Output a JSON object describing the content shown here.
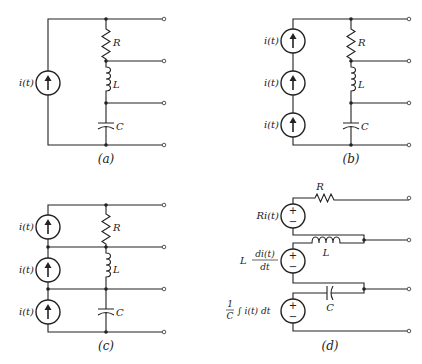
{
  "figure": {
    "panels": [
      {
        "id": "a",
        "caption": "(a)",
        "description": "Single current source i(t) driving series R-L-C with taps at each node",
        "sources": [
          {
            "label": "i(t)",
            "type": "current-source-arrow-up"
          }
        ],
        "components": [
          {
            "label": "R"
          },
          {
            "label": "L"
          },
          {
            "label": "C"
          }
        ],
        "terminals": 4
      },
      {
        "id": "b",
        "caption": "(b)",
        "description": "Three series current sources i(t) in parallel with series R-L-C",
        "sources": [
          {
            "label": "i(t)",
            "type": "current-source-arrow-up"
          },
          {
            "label": "i(t)",
            "type": "current-source-arrow-up"
          },
          {
            "label": "i(t)",
            "type": "current-source-arrow-up"
          }
        ],
        "components": [
          {
            "label": "R"
          },
          {
            "label": "L"
          },
          {
            "label": "C"
          }
        ],
        "terminals": 4
      },
      {
        "id": "c",
        "caption": "(c)",
        "description": "Each current source i(t) connected across R, L, C individually",
        "sources": [
          {
            "label": "i(t)",
            "type": "current-source-arrow-up"
          },
          {
            "label": "i(t)",
            "type": "current-source-arrow-up"
          },
          {
            "label": "i(t)",
            "type": "current-source-arrow-up"
          }
        ],
        "components": [
          {
            "label": "R"
          },
          {
            "label": "L"
          },
          {
            "label": "C"
          }
        ],
        "terminals": 4
      },
      {
        "id": "d",
        "caption": "(d)",
        "description": "Equivalent voltage sources in series with R, L, C",
        "sources": [
          {
            "label": "Ri(t)",
            "type": "voltage-source-plus-minus"
          },
          {
            "label_prefix": "L",
            "label_num": "di(t)",
            "label_den": "dt",
            "type": "voltage-source-plus-minus"
          },
          {
            "label_num": "1",
            "label_den": "C",
            "label_suffix": "∫ i(t) dt",
            "type": "voltage-source-plus-minus"
          }
        ],
        "components": [
          {
            "label": "R"
          },
          {
            "label": "L"
          },
          {
            "label": "C"
          }
        ],
        "plus": "+",
        "minus": "−",
        "terminals": 4
      }
    ]
  }
}
